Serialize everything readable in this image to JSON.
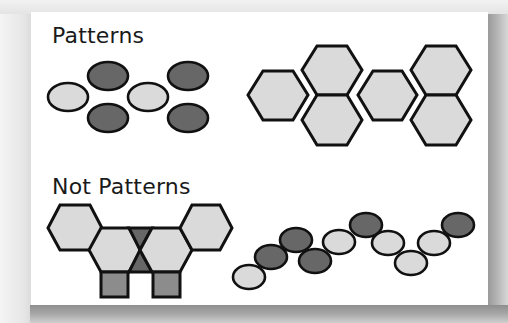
{
  "figure": {
    "sections": [
      {
        "id": "patterns",
        "title": "Patterns"
      },
      {
        "id": "not-patterns",
        "title": "Not Patterns"
      }
    ],
    "colors": {
      "light_fill": "#dadada",
      "dark_fill": "#676767",
      "medium_fill": "#8c8c8c",
      "stroke": "#111111",
      "card_bg": "#ffffff",
      "page_bg": "#ececec"
    },
    "examples": [
      {
        "section": "patterns",
        "name": "ellipse-pattern",
        "description": "Repeating unit: light ellipse followed by a vertical pair of dark ellipses, repeated twice",
        "shapes": [
          {
            "type": "ellipse",
            "fill": "light",
            "cx": 68,
            "cy": 97,
            "rx": 20,
            "ry": 14
          },
          {
            "type": "ellipse",
            "fill": "dark",
            "cx": 108,
            "cy": 76,
            "rx": 20,
            "ry": 14
          },
          {
            "type": "ellipse",
            "fill": "dark",
            "cx": 108,
            "cy": 118,
            "rx": 20,
            "ry": 14
          },
          {
            "type": "ellipse",
            "fill": "light",
            "cx": 148,
            "cy": 97,
            "rx": 20,
            "ry": 14
          },
          {
            "type": "ellipse",
            "fill": "dark",
            "cx": 188,
            "cy": 76,
            "rx": 20,
            "ry": 14
          },
          {
            "type": "ellipse",
            "fill": "dark",
            "cx": 188,
            "cy": 118,
            "rx": 20,
            "ry": 14
          }
        ]
      },
      {
        "section": "patterns",
        "name": "hexagon-pattern",
        "description": "Repeating unit: single hexagon followed by a vertical stack of two hexagons, repeated twice",
        "shapes": [
          {
            "type": "hexagon",
            "fill": "light",
            "points": "248,95 263,71 293,71 308,95 293,120 263,120"
          },
          {
            "type": "hexagon",
            "fill": "light",
            "points": "302,70 317,46 347,46 362,70 347,95 317,95"
          },
          {
            "type": "hexagon",
            "fill": "light",
            "points": "302,120 317,95 347,95 362,120 347,145 317,145"
          },
          {
            "type": "hexagon",
            "fill": "light",
            "points": "358,95 373,71 402,71 417,95 402,120 373,120"
          },
          {
            "type": "hexagon",
            "fill": "light",
            "points": "411,70 426,46 456,46 471,70 456,95 426,95"
          },
          {
            "type": "hexagon",
            "fill": "light",
            "points": "411,120 426,95 456,95 471,120 456,145 426,145"
          }
        ]
      },
      {
        "section": "not-patterns",
        "name": "hexagon-square-triangle-arrangement",
        "description": "Symmetric arrangement of hexagons, two dark triangles and two squares (not a repeating pattern)",
        "shapes": [
          {
            "type": "hexagon",
            "fill": "light",
            "points": "48,228 60,205 90,205 102,228 90,250 60,250"
          },
          {
            "type": "hexagon",
            "fill": "light",
            "points": "89,250 101,228 129,228 141,250 129,272 101,272"
          },
          {
            "type": "triangle",
            "fill": "dark",
            "points": "129,228 152,228 140,250"
          },
          {
            "type": "triangle",
            "fill": "dark",
            "points": "140,250 152,272 129,272"
          },
          {
            "type": "hexagon",
            "fill": "light",
            "points": "140,250 152,228 180,228 192,250 180,272 152,272"
          },
          {
            "type": "hexagon",
            "fill": "light",
            "points": "180,228 192,205 220,205 232,228 220,250 192,250"
          },
          {
            "type": "square",
            "fill": "medium",
            "x": 101,
            "y": 272,
            "w": 27,
            "h": 25
          },
          {
            "type": "square",
            "fill": "medium",
            "x": 153,
            "y": 272,
            "w": 27,
            "h": 25
          }
        ]
      },
      {
        "section": "not-patterns",
        "name": "ellipse-zigzag-arrangement",
        "description": "Irregular zig-zag chain of light and dark ellipses (not a repeating pattern)",
        "shapes": [
          {
            "type": "ellipse",
            "fill": "light",
            "cx": 249,
            "cy": 277,
            "rx": 16,
            "ry": 12
          },
          {
            "type": "ellipse",
            "fill": "dark",
            "cx": 271,
            "cy": 257,
            "rx": 16,
            "ry": 12
          },
          {
            "type": "ellipse",
            "fill": "dark",
            "cx": 296,
            "cy": 240,
            "rx": 16,
            "ry": 12
          },
          {
            "type": "ellipse",
            "fill": "dark",
            "cx": 315,
            "cy": 261,
            "rx": 16,
            "ry": 12
          },
          {
            "type": "ellipse",
            "fill": "light",
            "cx": 339,
            "cy": 242,
            "rx": 16,
            "ry": 12
          },
          {
            "type": "ellipse",
            "fill": "dark",
            "cx": 366,
            "cy": 225,
            "rx": 16,
            "ry": 12
          },
          {
            "type": "ellipse",
            "fill": "light",
            "cx": 388,
            "cy": 243,
            "rx": 16,
            "ry": 12
          },
          {
            "type": "ellipse",
            "fill": "light",
            "cx": 411,
            "cy": 263,
            "rx": 16,
            "ry": 12
          },
          {
            "type": "ellipse",
            "fill": "light",
            "cx": 434,
            "cy": 243,
            "rx": 16,
            "ry": 12
          },
          {
            "type": "ellipse",
            "fill": "dark",
            "cx": 458,
            "cy": 225,
            "rx": 16,
            "ry": 12
          }
        ]
      }
    ]
  }
}
